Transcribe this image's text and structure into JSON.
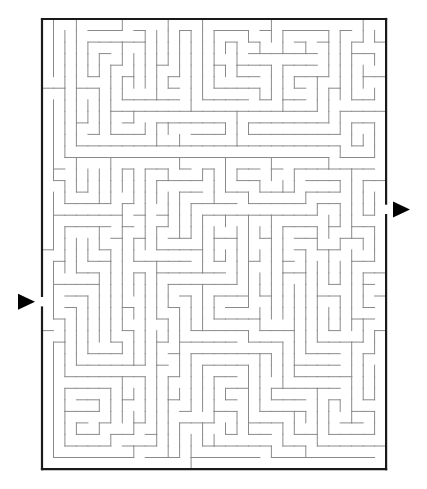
{
  "puzzle": {
    "type": "rectangular-maze",
    "origin": [
      42,
      19
    ],
    "cols": 30,
    "rows": 39,
    "cell_w": 11.47,
    "cell_h": 11.54,
    "seed": 73129,
    "entrance": {
      "side": "left",
      "row": 24,
      "arrow_icon": "right-pointing-triangle"
    },
    "exit": {
      "side": "right",
      "row": 16,
      "arrow_icon": "right-pointing-triangle"
    },
    "colors": {
      "border": "#1a1a1a",
      "walls": "#8a8a8a",
      "arrows": "#000000",
      "background": "#ffffff"
    }
  }
}
